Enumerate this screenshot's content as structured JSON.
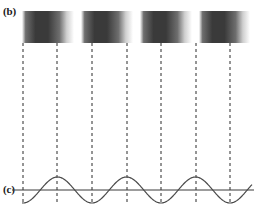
{
  "figure": {
    "width": 261,
    "height": 214,
    "background": "#ffffff",
    "panels": {
      "b": {
        "label": "(b)",
        "description": "interference fringe bands"
      },
      "c": {
        "label": "(c)",
        "description": "sinusoidal intensity waveform"
      }
    }
  },
  "fringes": {
    "count": 4,
    "region": {
      "x": 22,
      "y": 11,
      "width": 228,
      "height": 32
    },
    "band_width": 52,
    "band_gap": 7,
    "dark_color": "#3a3a3a",
    "mid_color": "#6e6e6e",
    "light_color": "#ffffff",
    "bands": [
      {
        "index": 1,
        "x": 22,
        "width": 52
      },
      {
        "index": 2,
        "x": 81,
        "width": 52
      },
      {
        "index": 3,
        "x": 140,
        "width": 52
      },
      {
        "index": 4,
        "x": 199,
        "width": 51
      }
    ]
  },
  "guide_lines": {
    "count": 7,
    "style": "dashed",
    "color": "#2b2b2b",
    "dash_pattern": "3,3",
    "stroke_width": 1,
    "y_top": 43,
    "y_bottom": 203,
    "x_positions": [
      23,
      57,
      92,
      127,
      161,
      196,
      230
    ]
  },
  "waveform": {
    "type": "sine",
    "axis_color": "#3a3a3a",
    "curve_color": "#4a4a4a",
    "stroke_width": 1.2,
    "baseline_y": 190,
    "amplitude": 13,
    "wavelength": 69,
    "phase": "trough-at-first-guide-line",
    "x_start": 22,
    "x_end": 252
  },
  "chart_data": {
    "type": "line",
    "title": "",
    "xlabel": "",
    "ylabel": "Intensity",
    "series": [
      {
        "name": "intensity",
        "description": "cosine intensity profile; minima at x=23,92,161,230 and maxima at x=57,127,196",
        "minima_x": [
          23,
          92,
          161,
          230
        ],
        "maxima_x": [
          57,
          127,
          196
        ],
        "amplitude": 1.0,
        "baseline": 0.0
      }
    ],
    "ylim": [
      -1,
      1
    ],
    "grid": false,
    "legend": "none"
  }
}
